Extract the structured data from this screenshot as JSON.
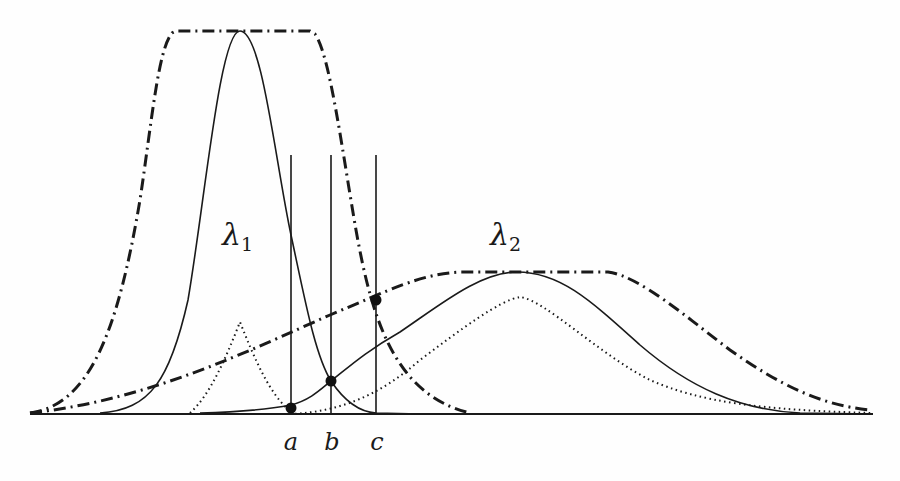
{
  "diagram": {
    "labels": {
      "lambda1": "λ",
      "lambda1_sub": "1",
      "lambda2": "λ",
      "lambda2_sub": "2",
      "a": "a",
      "b": "b",
      "c": "c"
    },
    "curves": [
      {
        "name": "lambda1-density",
        "style": "solid",
        "peak_x": 240,
        "peak_y": 31
      },
      {
        "name": "lambda1-envelope",
        "style": "dash-dot",
        "plateau_from": 168,
        "plateau_to": 313,
        "plateau_y": 31
      },
      {
        "name": "lambda1-dotted-peak",
        "style": "dotted",
        "peak_x": 240,
        "peak_y": 322
      },
      {
        "name": "lambda2-density",
        "style": "solid",
        "peak_x": 517,
        "peak_y": 272
      },
      {
        "name": "lambda2-envelope",
        "style": "dash-dot",
        "plateau_from": 458,
        "plateau_to": 608,
        "plateau_y": 272
      },
      {
        "name": "lambda2-dotted-peak",
        "style": "dotted",
        "peak_x": 520,
        "peak_y": 297
      }
    ],
    "thresholds": [
      {
        "label": "a",
        "x": 291,
        "marker_y": 408
      },
      {
        "label": "b",
        "x": 331,
        "marker_y": 381
      },
      {
        "label": "c",
        "x": 376,
        "marker_y": 300
      }
    ],
    "colors": {
      "stroke": "#1a1a1a",
      "background": "#fefefe"
    }
  }
}
